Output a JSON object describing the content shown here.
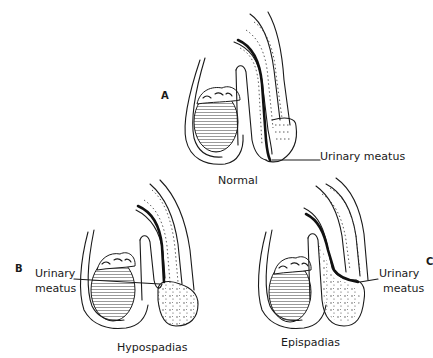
{
  "figure": {
    "panels": [
      {
        "letter": "A",
        "caption": "Normal",
        "annotation": "Urinary meatus"
      },
      {
        "letter": "B",
        "caption": "Hypospadias",
        "annotation_line1": "Urinary",
        "annotation_line2": "meatus"
      },
      {
        "letter": "C",
        "caption": "Epispadias",
        "annotation_line1": "Urinary",
        "annotation_line2": "meatus"
      }
    ],
    "colors": {
      "ink": "#1a1a1a",
      "background": "#ffffff"
    }
  }
}
